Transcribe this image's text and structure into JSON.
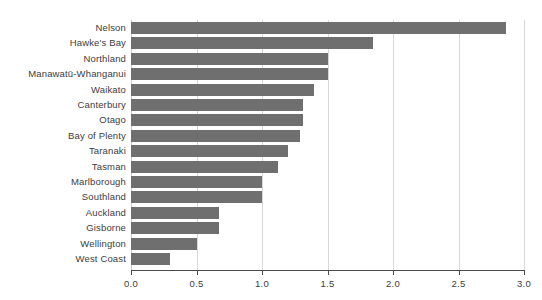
{
  "chart_data": {
    "type": "bar",
    "orientation": "horizontal",
    "title": "",
    "subtitle": "",
    "xlabel": "",
    "ylabel": "",
    "xlim": [
      0.0,
      3.0
    ],
    "xticks": [
      0.0,
      0.5,
      1.0,
      1.5,
      2.0,
      2.5,
      3.0
    ],
    "xtick_labels": [
      "0.0",
      "0.5",
      "1.0",
      "1.5",
      "2.0",
      "2.5",
      "3.0"
    ],
    "grid": "vertical",
    "legend": "none",
    "bar_color": "#6f6f6f",
    "gridline_color": "#d8d8d8",
    "axis_color": "#4a4a4a",
    "text_color": "#3d3d3d",
    "background": "#ffffff",
    "categories": [
      "Nelson",
      "Hawke's Bay",
      "Northland",
      "Manawatū-Whanganui",
      "Waikato",
      "Canterbury",
      "Otago",
      "Bay of Plenty",
      "Taranaki",
      "Tasman",
      "Marlborough",
      "Southland",
      "Auckland",
      "Gisborne",
      "Wellington",
      "West Coast"
    ],
    "values": [
      2.86,
      1.85,
      1.5,
      1.5,
      1.4,
      1.31,
      1.31,
      1.29,
      1.2,
      1.12,
      1.0,
      1.0,
      0.67,
      0.67,
      0.5,
      0.3
    ]
  }
}
